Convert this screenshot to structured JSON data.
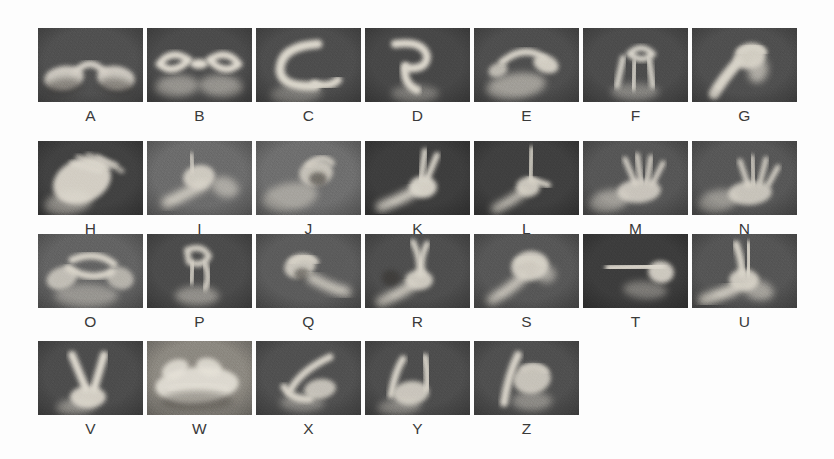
{
  "figure": {
    "background_color": "#fdfdfd",
    "label_color": "#3a3a3a",
    "columns_per_row": [
      7,
      7,
      7,
      5
    ],
    "rows": [
      {
        "row_index": 0,
        "cells": [
          {
            "label": "A",
            "sign": "asl-letter-a-photo",
            "bg": "#4f4f4f",
            "hand_tone": "#d9d4cb",
            "pose": "a"
          },
          {
            "label": "B",
            "sign": "asl-letter-b-photo",
            "bg": "#4a4a4a",
            "hand_tone": "#e4dfd4",
            "pose": "b"
          },
          {
            "label": "C",
            "sign": "asl-letter-c-photo",
            "bg": "#4c4c4c",
            "hand_tone": "#e0dbd0",
            "pose": "c"
          },
          {
            "label": "D",
            "sign": "asl-letter-d-photo",
            "bg": "#464646",
            "hand_tone": "#e2ddd2",
            "pose": "d"
          },
          {
            "label": "E",
            "sign": "asl-letter-e-photo",
            "bg": "#4d4d4d",
            "hand_tone": "#ddd8cd",
            "pose": "e"
          },
          {
            "label": "F",
            "sign": "asl-letter-f-photo",
            "bg": "#4b4b4b",
            "hand_tone": "#dedad0",
            "pose": "f"
          },
          {
            "label": "G",
            "sign": "asl-letter-g-photo",
            "bg": "#4e4e4e",
            "hand_tone": "#dcd7cc",
            "pose": "g"
          }
        ]
      },
      {
        "row_index": 1,
        "cells": [
          {
            "label": "H",
            "sign": "asl-letter-h-photo",
            "bg": "#3f3f3f",
            "hand_tone": "#e3ded3",
            "pose": "h"
          },
          {
            "label": "I",
            "sign": "asl-letter-i-photo",
            "bg": "#6c6c6c",
            "hand_tone": "#ddd8cd",
            "pose": "i"
          },
          {
            "label": "J",
            "sign": "asl-letter-j-photo",
            "bg": "#6f6f6f",
            "hand_tone": "#d9d4c9",
            "pose": "j"
          },
          {
            "label": "K",
            "sign": "asl-letter-k-photo",
            "bg": "#3b3b3b",
            "hand_tone": "#e0dbd0",
            "pose": "k"
          },
          {
            "label": "L",
            "sign": "asl-letter-l-photo",
            "bg": "#3d3d3d",
            "hand_tone": "#ded9ce",
            "pose": "l"
          },
          {
            "label": "M",
            "sign": "asl-letter-m-photo",
            "bg": "#555555",
            "hand_tone": "#e1dcd1",
            "pose": "m"
          },
          {
            "label": "N",
            "sign": "asl-letter-n-photo",
            "bg": "#565656",
            "hand_tone": "#e0dbd0",
            "pose": "n"
          }
        ]
      },
      {
        "row_index": 2,
        "cells": [
          {
            "label": "O",
            "sign": "asl-letter-o-photo",
            "bg": "#636363",
            "hand_tone": "#ddd8cd",
            "pose": "o"
          },
          {
            "label": "P",
            "sign": "asl-letter-p-photo",
            "bg": "#4a4a4a",
            "hand_tone": "#dcd7cc",
            "pose": "p"
          },
          {
            "label": "Q",
            "sign": "asl-letter-q-photo",
            "bg": "#5b5b5b",
            "hand_tone": "#dad5ca",
            "pose": "q"
          },
          {
            "label": "R",
            "sign": "asl-letter-r-photo",
            "bg": "#4d4d4d",
            "hand_tone": "#dfdacf",
            "pose": "r"
          },
          {
            "label": "S",
            "sign": "asl-letter-s-photo",
            "bg": "#565656",
            "hand_tone": "#ddd8cd",
            "pose": "s"
          },
          {
            "label": "T",
            "sign": "asl-letter-t-photo",
            "bg": "#3a3a3a",
            "hand_tone": "#e1dcd1",
            "pose": "t"
          },
          {
            "label": "U",
            "sign": "asl-letter-u-photo",
            "bg": "#545454",
            "hand_tone": "#ded9ce",
            "pose": "u"
          }
        ]
      },
      {
        "row_index": 3,
        "cells": [
          {
            "label": "V",
            "sign": "asl-letter-v-photo",
            "bg": "#4b4b4b",
            "hand_tone": "#e2ddd2",
            "pose": "v"
          },
          {
            "label": "W",
            "sign": "asl-letter-w-photo",
            "bg": "#8e8a82",
            "hand_tone": "#eae6dc",
            "pose": "w"
          },
          {
            "label": "X",
            "sign": "asl-letter-x-photo",
            "bg": "#4f4f4f",
            "hand_tone": "#ddd8cd",
            "pose": "x"
          },
          {
            "label": "Y",
            "sign": "asl-letter-y-photo",
            "bg": "#4c4c4c",
            "hand_tone": "#dfdacf",
            "pose": "y"
          },
          {
            "label": "Z",
            "sign": "asl-letter-z-photo",
            "bg": "#4e4e4e",
            "hand_tone": "#dcd7cc",
            "pose": "z"
          }
        ]
      }
    ]
  }
}
